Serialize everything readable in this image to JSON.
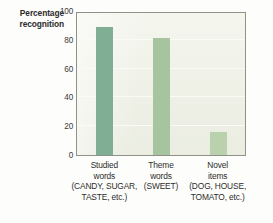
{
  "chart_data": {
    "type": "bar",
    "title": "",
    "xlabel": "",
    "ylabel": "Percentage recognition",
    "ylim": [
      0,
      100
    ],
    "yticks": [
      100,
      80,
      60,
      40,
      20,
      0
    ],
    "grid": true,
    "legend": "none",
    "categories": [
      "Studied words (CANDY, SUGAR, TASTE, etc.)",
      "Theme words (SWEET)",
      "Novel items (DOG, HOUSE, TOMATO, etc.)"
    ],
    "values": [
      89,
      81,
      16
    ],
    "bars": [
      {
        "category": "Studied words",
        "value": 89,
        "color": "#7fae95",
        "label_lines": [
          "Studied",
          "words",
          "(CANDY, SUGAR,",
          "TASTE, etc.)"
        ]
      },
      {
        "category": "Theme words",
        "value": 81,
        "color": "#a6c49d",
        "label_lines": [
          "Theme",
          "words",
          "(SWEET)"
        ]
      },
      {
        "category": "Novel items",
        "value": 16,
        "color": "#b9d2ad",
        "label_lines": [
          "Novel",
          "items",
          "(DOG, HOUSE,",
          "TOMATO, etc.)"
        ]
      }
    ]
  },
  "axis": {
    "y_title_lines": [
      "Percentage",
      "recognition"
    ],
    "y_tick_labels": [
      "100",
      "80",
      "60",
      "40",
      "20",
      "0"
    ]
  },
  "colors": {
    "plot_background": "#edefe4",
    "plot_border": "#8e9287",
    "gridline": "#fafbf5",
    "page_background": "#fdfdfb",
    "text": "#2d2d2d"
  }
}
